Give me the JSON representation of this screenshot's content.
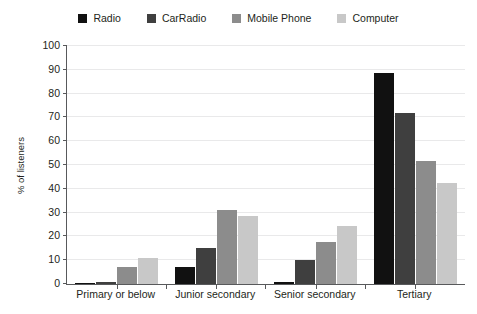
{
  "chart_data": {
    "type": "bar",
    "title": "",
    "xlabel": "",
    "ylabel": "% of listeners",
    "ylim": [
      0,
      100
    ],
    "ytick_step": 10,
    "yticks": [
      100,
      90,
      80,
      70,
      60,
      50,
      40,
      30,
      20,
      10,
      0
    ],
    "grid": true,
    "legend_position": "top-center",
    "categories": [
      "Primary or below",
      "Junior secondary",
      "Senior secondary",
      "Tertiary"
    ],
    "series": [
      {
        "name": "Radio",
        "color": "#111111",
        "values": [
          0.5,
          7,
          1,
          88.5
        ]
      },
      {
        "name": "CarRadio",
        "color": "#3f3f3f",
        "values": [
          1,
          15,
          10,
          72
        ]
      },
      {
        "name": "Mobile Phone",
        "color": "#8c8c8c",
        "values": [
          7,
          31,
          17.5,
          51.5
        ]
      },
      {
        "name": "Computer",
        "color": "#c8c8c8",
        "values": [
          11,
          28.5,
          24.5,
          42.5
        ]
      }
    ]
  }
}
